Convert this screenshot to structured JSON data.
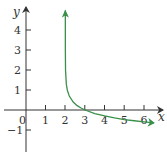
{
  "chart_data": {
    "type": "line",
    "title": "",
    "xlabel": "x",
    "ylabel": "y",
    "xlim": [
      -1,
      7
    ],
    "ylim": [
      -2,
      5
    ],
    "grid": false,
    "x_ticks": [
      "0",
      "1",
      "2",
      "3",
      "4",
      "5",
      "6"
    ],
    "y_ticks": [
      "−1",
      "1",
      "2",
      "3",
      "4"
    ],
    "series": [
      {
        "name": "y = -log10(x - 2)",
        "color": "#3a8f4a",
        "vertical_asymptote": 2,
        "x": [
          2.00001,
          2.0001,
          2.001,
          2.01,
          2.05,
          2.1,
          2.2,
          2.4,
          2.6,
          2.8,
          3,
          3.5,
          4,
          4.5,
          5,
          5.5,
          6,
          6.5
        ],
        "y": [
          5,
          4,
          3,
          2,
          1.3,
          1,
          0.7,
          0.4,
          0.22,
          0.1,
          0,
          -0.18,
          -0.3,
          -0.4,
          -0.48,
          -0.54,
          -0.6,
          -0.65
        ]
      }
    ]
  },
  "labels": {
    "origin": "0",
    "x_axis": "x",
    "y_axis": "y"
  }
}
